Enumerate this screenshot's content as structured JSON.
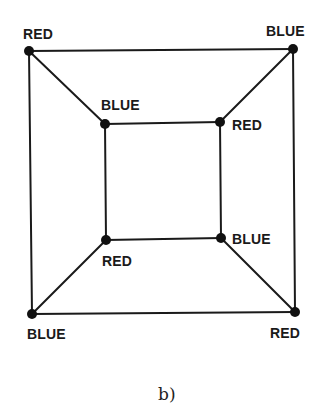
{
  "diagram": {
    "caption": "b)",
    "nodes": [
      {
        "id": "outer-tl",
        "label": "RED",
        "x": 29,
        "y": 51
      },
      {
        "id": "outer-tr",
        "label": "BLUE",
        "x": 293,
        "y": 49
      },
      {
        "id": "outer-bl",
        "label": "BLUE",
        "x": 32,
        "y": 314
      },
      {
        "id": "outer-br",
        "label": "RED",
        "x": 295,
        "y": 312
      },
      {
        "id": "inner-tl",
        "label": "BLUE",
        "x": 105,
        "y": 124
      },
      {
        "id": "inner-tr",
        "label": "RED",
        "x": 220,
        "y": 122
      },
      {
        "id": "inner-bl",
        "label": "RED",
        "x": 106,
        "y": 240
      },
      {
        "id": "inner-br",
        "label": "BLUE",
        "x": 221,
        "y": 238
      }
    ],
    "edges": [
      [
        "outer-tl",
        "outer-tr"
      ],
      [
        "outer-tr",
        "outer-br"
      ],
      [
        "outer-br",
        "outer-bl"
      ],
      [
        "outer-bl",
        "outer-tl"
      ],
      [
        "inner-tl",
        "inner-tr"
      ],
      [
        "inner-tr",
        "inner-br"
      ],
      [
        "inner-br",
        "inner-bl"
      ],
      [
        "inner-bl",
        "inner-tl"
      ],
      [
        "outer-tl",
        "inner-tl"
      ],
      [
        "outer-tr",
        "inner-tr"
      ],
      [
        "outer-br",
        "inner-br"
      ],
      [
        "outer-bl",
        "inner-bl"
      ]
    ]
  }
}
